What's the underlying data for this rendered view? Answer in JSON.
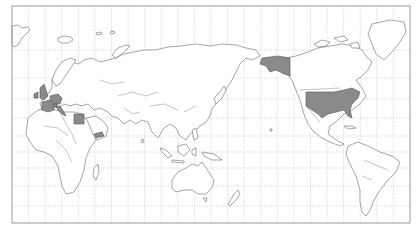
{
  "map": {
    "projection": "Mercator, Pacific-centered",
    "frame": {
      "x": 12,
      "y": 6,
      "width": 398,
      "height": 217
    },
    "grid": {
      "meridian_count": 24,
      "parallels_y": [
        50,
        78,
        99,
        118,
        136,
        152,
        168,
        186,
        206
      ]
    },
    "colors": {
      "background": "#ffffff",
      "land": "#ffffff",
      "highlight": "#8a8a8a",
      "outline": "#6a6a6a",
      "grid": "#b5b5b5"
    },
    "highlighted_countries": [
      "United Kingdom",
      "Ireland",
      "France",
      "Germany",
      "Belgium",
      "Netherlands",
      "Luxembourg",
      "Switzerland",
      "Italy",
      "Egypt",
      "Yemen",
      "United States (incl. Alaska)"
    ]
  }
}
